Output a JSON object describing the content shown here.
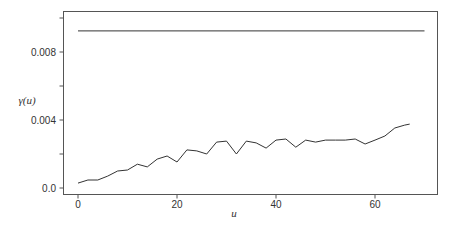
{
  "chart_data": {
    "type": "line",
    "title": "",
    "xlabel": "u",
    "ylabel": "γ(u)",
    "xlim": [
      -3,
      72.5
    ],
    "ylim": [
      -0.00038,
      0.0104
    ],
    "grid": false,
    "legend": null,
    "x_ticks": [
      0,
      20,
      40,
      60
    ],
    "x_tick_labels": [
      "0",
      "20",
      "40",
      "60"
    ],
    "y_ticks": [
      0.0,
      0.002,
      0.004,
      0.006,
      0.008,
      0.01
    ],
    "y_tick_labels": [
      "0.0",
      "",
      "0.004",
      "",
      "0.008",
      ""
    ],
    "series": [
      {
        "name": "empirical variogram",
        "x": [
          0,
          2,
          4,
          6,
          8,
          10,
          12,
          14,
          16,
          18,
          20,
          22,
          24,
          26,
          28,
          30,
          32,
          34,
          36,
          38,
          40,
          42,
          44,
          46,
          48,
          50,
          52,
          54,
          56,
          58,
          60,
          62,
          64,
          66,
          67
        ],
        "values": [
          0.00029,
          0.00047,
          0.00047,
          0.0007,
          0.001,
          0.00106,
          0.0014,
          0.00124,
          0.0017,
          0.00188,
          0.00153,
          0.00224,
          0.00218,
          0.002,
          0.0027,
          0.00276,
          0.002,
          0.00276,
          0.00265,
          0.00235,
          0.00282,
          0.00288,
          0.0024,
          0.00282,
          0.0027,
          0.00282,
          0.00282,
          0.00282,
          0.00288,
          0.00259,
          0.00282,
          0.00306,
          0.00353,
          0.0037,
          0.00376
        ]
      },
      {
        "name": "reference level",
        "x": [
          0,
          70
        ],
        "values": [
          0.00924,
          0.00924
        ]
      }
    ]
  }
}
